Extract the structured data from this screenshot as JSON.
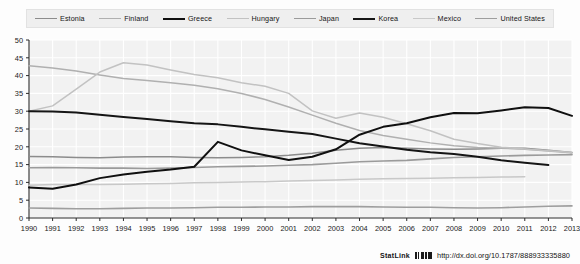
{
  "footer": {
    "statlink_label": "StatLink",
    "statlink_icon": "barcode-icon",
    "url": "http://dx.doi.org/10.1787/888933335880"
  },
  "chart_data": {
    "type": "line",
    "title": "",
    "subtitle": "",
    "xlabel": "",
    "ylabel": "",
    "xlim": [
      1990,
      2013
    ],
    "ylim": [
      0,
      50
    ],
    "ytick_step": 5,
    "grid": true,
    "legend_position": "top",
    "categories": [
      1990,
      1991,
      1992,
      1993,
      1994,
      1995,
      1996,
      1997,
      1998,
      1999,
      2000,
      2001,
      2002,
      2003,
      2004,
      2005,
      2006,
      2007,
      2008,
      2009,
      2010,
      2011,
      2012,
      2013
    ],
    "yticks": [
      0,
      5,
      10,
      15,
      20,
      25,
      30,
      35,
      40,
      45,
      50
    ],
    "xticks": [
      "1990",
      "1991",
      "1992",
      "1993",
      "1994",
      "1995",
      "1996",
      "1997",
      "1998",
      "1999",
      "2000",
      "2001",
      "2002",
      "2003",
      "2004",
      "2005",
      "2006",
      "2007",
      "2008",
      "2009",
      "2010",
      "2011",
      "2012",
      "2013"
    ],
    "series": [
      {
        "name": "Estonia",
        "color": "#8c8c8c",
        "width": 1.5,
        "values": [
          17.3,
          17.2,
          17.0,
          16.9,
          17.1,
          17.2,
          17.2,
          17.0,
          16.9,
          17.0,
          17.2,
          17.6,
          18.2,
          19.0,
          19.6,
          19.8,
          19.6,
          19.4,
          19.3,
          19.4,
          19.6,
          19.6,
          19.0,
          18.4
        ]
      },
      {
        "name": "Finland",
        "color": "#b0b0b0",
        "width": 1.5,
        "values": [
          42.8,
          42.1,
          41.3,
          40.2,
          39.2,
          38.6,
          38.0,
          37.3,
          36.3,
          35.0,
          33.3,
          31.2,
          28.9,
          26.6,
          24.6,
          23.2,
          22.1,
          21.1,
          20.3,
          19.8,
          19.6,
          19.3,
          18.8,
          18.3
        ]
      },
      {
        "name": "Greece",
        "color": "#101010",
        "width": 2.0,
        "values": [
          8.6,
          8.2,
          9.4,
          11.2,
          12.2,
          13.0,
          13.6,
          14.4,
          21.4,
          19.0,
          17.6,
          16.3,
          17.2,
          19.3,
          23.4,
          25.6,
          26.6,
          28.3,
          29.5,
          29.4,
          30.2,
          31.1,
          30.9,
          28.7
        ]
      },
      {
        "name": "Hungary",
        "color": "#c2c2c2",
        "width": 1.5,
        "values": [
          30.0,
          31.5,
          36.2,
          41.0,
          43.6,
          43.0,
          41.6,
          40.3,
          39.4,
          38.0,
          37.0,
          35.0,
          30.1,
          28.0,
          29.5,
          28.3,
          26.5,
          24.5,
          22.1,
          20.9,
          19.9,
          19.4,
          18.9,
          18.4
        ]
      },
      {
        "name": "Japan",
        "color": "#9b9b9b",
        "width": 1.6,
        "values": [
          14.1,
          14.2,
          14.1,
          14.0,
          14.0,
          13.9,
          14.0,
          14.2,
          14.4,
          14.5,
          14.6,
          14.8,
          15.0,
          15.4,
          15.8,
          16.0,
          16.2,
          16.6,
          17.0,
          17.2,
          17.4,
          17.6,
          17.7,
          17.8
        ]
      },
      {
        "name": "Korea",
        "color": "#151515",
        "width": 2.0,
        "values": [
          30.0,
          29.9,
          29.6,
          29.0,
          28.4,
          27.8,
          27.2,
          26.6,
          26.3,
          25.6,
          24.9,
          24.2,
          23.6,
          22.3,
          21.0,
          20.1,
          19.2,
          18.5,
          18.0,
          17.2,
          16.2,
          15.5,
          14.9,
          null
        ]
      },
      {
        "name": "Mexico",
        "color": "#c8c8c8",
        "width": 1.5,
        "values": [
          9.2,
          9.4,
          9.4,
          9.4,
          9.5,
          9.6,
          9.7,
          9.9,
          10.0,
          10.1,
          10.2,
          10.4,
          10.5,
          10.7,
          10.9,
          11.0,
          11.1,
          11.2,
          11.3,
          11.4,
          11.5,
          11.6,
          null,
          null
        ]
      },
      {
        "name": "United States",
        "color": "#9e9e9e",
        "width": 1.6,
        "values": [
          2.8,
          2.7,
          2.6,
          2.6,
          2.7,
          2.8,
          2.8,
          2.9,
          3.0,
          3.0,
          3.1,
          3.1,
          3.2,
          3.2,
          3.2,
          3.1,
          3.0,
          3.0,
          2.9,
          2.8,
          2.9,
          3.1,
          3.3,
          3.4
        ]
      }
    ]
  },
  "legend": {
    "items": [
      {
        "label": "Estonia",
        "color": "#8c8c8c",
        "width": 1.5
      },
      {
        "label": "Finland",
        "color": "#b0b0b0",
        "width": 1.5
      },
      {
        "label": "Greece",
        "color": "#101010",
        "width": 2.4
      },
      {
        "label": "Hungary",
        "color": "#c2c2c2",
        "width": 1.3
      },
      {
        "label": "Japan",
        "color": "#9b9b9b",
        "width": 1.6
      },
      {
        "label": "Korea",
        "color": "#151515",
        "width": 2.4
      },
      {
        "label": "Mexico",
        "color": "#c8c8c8",
        "width": 1.3
      },
      {
        "label": "United States",
        "color": "#9e9e9e",
        "width": 1.8
      }
    ]
  }
}
